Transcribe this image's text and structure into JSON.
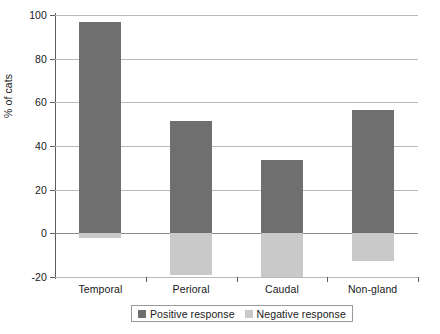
{
  "chart_data": {
    "type": "bar",
    "title": "",
    "xlabel": "",
    "ylabel": "% of cats",
    "categories": [
      "Temporal",
      "Perioral",
      "Caudal",
      "Non-gland"
    ],
    "series": [
      {
        "name": "Positive response",
        "color": "#706f6f",
        "values": [
          97,
          51.5,
          33.5,
          56.5
        ]
      },
      {
        "name": "Negative response",
        "color": "#c9c9c9",
        "values": [
          -2,
          -19,
          -20,
          -12.5
        ]
      }
    ],
    "ylim": [
      -20,
      100
    ],
    "yticks": [
      -20,
      0,
      20,
      40,
      60,
      80,
      100
    ],
    "ytick_labels": [
      "-20",
      "0",
      "20",
      "40",
      "60",
      "80",
      "100"
    ],
    "grid": "horizontal",
    "legend_position": "bottom",
    "legend_entries": [
      "Positive response",
      "Negative response"
    ]
  }
}
